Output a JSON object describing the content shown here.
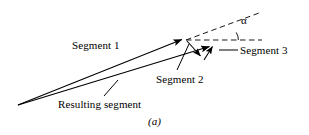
{
  "figure": {
    "caption": "(a)",
    "background_color": "#ffffff",
    "stroke_color": "#000000",
    "labels": {
      "segment_1": "Segment 1",
      "segment_2": "Segment 2",
      "segment_3": "Segment 3",
      "resulting_segment": "Resulting segment",
      "angle": "α"
    },
    "icons": {
      "arrowhead": "arrowhead-icon",
      "angle_arc": "angle-arc-icon",
      "dashed_line": "dashed-line-icon"
    },
    "geometry": {
      "apex": [
        18,
        105
      ],
      "segment_1": {
        "from": [
          18,
          105
        ],
        "to": [
          186,
          38
        ],
        "arrow": true
      },
      "segment_2": {
        "from": [
          186,
          38
        ],
        "to": [
          204,
          59
        ],
        "arrow": true
      },
      "segment_3": {
        "from": [
          204,
          59
        ],
        "to": [
          215,
          43
        ],
        "arrow": true
      },
      "resulting_segment": {
        "from": [
          18,
          105
        ],
        "to": [
          214,
          45
        ],
        "arrow": true
      },
      "dashed_horizontal": {
        "from": [
          186,
          40
        ],
        "to": [
          262,
          40
        ]
      },
      "dashed_diagonal": {
        "from": [
          186,
          40
        ],
        "to": [
          259,
          13
        ]
      },
      "angle_vertex": [
        186,
        40
      ],
      "angle_marker_x": 238
    }
  }
}
